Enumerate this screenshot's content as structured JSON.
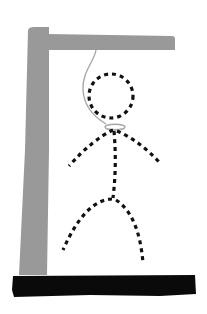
{
  "game": {
    "name": "hangman",
    "stage": "complete",
    "parts_drawn": [
      "gallows-base",
      "gallows-post",
      "gallows-beam",
      "rope",
      "head",
      "torso",
      "left-arm",
      "right-arm",
      "left-leg",
      "right-leg"
    ]
  },
  "colors": {
    "background": "#ffffff",
    "gallows": "#999999",
    "base": "#0a0a0a",
    "rope": "#a8a8a8",
    "figure": "#111111"
  }
}
